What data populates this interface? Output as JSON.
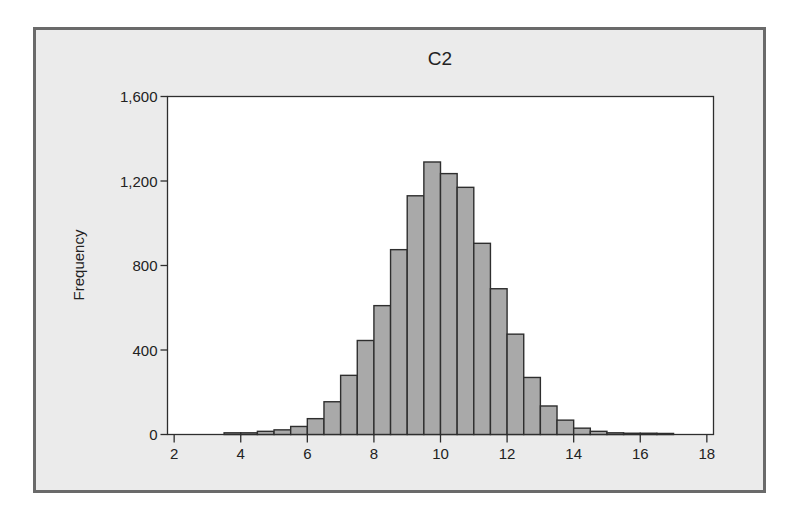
{
  "chart_data": {
    "type": "bar",
    "subtype": "histogram",
    "title": "C2",
    "xlabel": "",
    "ylabel": "Frequency",
    "xlim": [
      1.8,
      18.2
    ],
    "ylim": [
      0,
      1600
    ],
    "x_ticks": [
      2,
      4,
      6,
      8,
      10,
      12,
      14,
      16,
      18
    ],
    "y_ticks": [
      0,
      400,
      800,
      1200,
      1600
    ],
    "y_tick_labels": [
      "0",
      "400",
      "800",
      "1,200",
      "1,600"
    ],
    "bin_width": 0.5,
    "bin_edges": [
      3.5,
      4,
      4.5,
      5,
      5.5,
      6,
      6.5,
      7,
      7.5,
      8,
      8.5,
      9,
      9.5,
      10,
      10.5,
      11,
      11.5,
      12,
      12.5,
      13,
      13.5,
      14,
      14.5,
      15,
      15.5,
      16,
      16.5,
      17
    ],
    "values": [
      8,
      8,
      15,
      22,
      38,
      75,
      155,
      280,
      445,
      610,
      875,
      1130,
      1290,
      1235,
      1170,
      905,
      690,
      475,
      270,
      135,
      68,
      30,
      15,
      8,
      6,
      6,
      5
    ],
    "grid": false,
    "legend": null,
    "colors": {
      "bar_fill": "#a9a9a9",
      "bar_edge": "#2e2e2e",
      "plot_bg": "#ffffff",
      "panel_bg": "#ebebeb",
      "frame": "#6a6a6a",
      "text": "#222222"
    }
  }
}
